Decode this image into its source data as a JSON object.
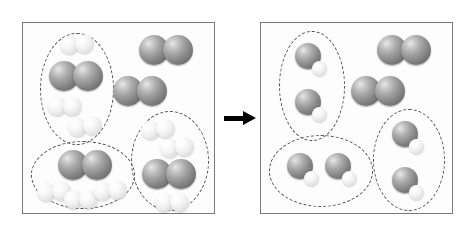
{
  "figure": {
    "width": 476,
    "height": 236,
    "background": "#ffffff",
    "description": "Particle-level before-and-after diagram of a chemical reaction shown in two bordered boxes separated by a right-pointing reaction arrow."
  },
  "colors": {
    "panel_border": "#7a7a7a",
    "panel_background": "#fdfdfd",
    "group_outline": "#4a4a4a",
    "dark_atom": "#8a8a8a",
    "light_atom": "#efefef",
    "arrow": "#000000"
  },
  "arrow": {
    "name": "reaction-arrow",
    "direction": "right",
    "color": "#000000",
    "label": ""
  },
  "legend": {
    "dark_diatomic": "dark two-atom molecule (reactant A2)",
    "light_diatomic": "light two-atom molecule (reactant B2)",
    "product": "large dark atom bonded to one small light atom (product AB)"
  },
  "panels": [
    {
      "id": "before",
      "name": "before-panel",
      "title": "Before reaction",
      "groups": [
        {
          "id": "before-group-1",
          "name": "reactant-group-top-left",
          "shape": "oval",
          "x": 17,
          "y": 10,
          "w": 74,
          "h": 112,
          "contents": {
            "dark_diatomic": 1,
            "light_diatomic": 3
          },
          "molecules": [
            {
              "type": "diatomic-light",
              "x": 20,
              "y": 2,
              "rot": -4
            },
            {
              "type": "diatomic-dark",
              "x": 9,
              "y": 28,
              "rot": 0
            },
            {
              "type": "diatomic-light",
              "x": 8,
              "y": 64,
              "rot": 0
            },
            {
              "type": "diatomic-light",
              "x": 28,
              "y": 84,
              "rot": -6
            }
          ]
        },
        {
          "id": "before-group-2",
          "name": "reactant-group-bottom-left",
          "shape": "oval",
          "x": 8,
          "y": 118,
          "w": 104,
          "h": 68,
          "contents": {
            "dark_diatomic": 1,
            "light_diatomic": 3
          },
          "molecules": [
            {
              "type": "diatomic-dark",
              "x": 27,
              "y": 9,
              "rot": 0
            },
            {
              "type": "diatomic-light",
              "x": 6,
              "y": 41,
              "rot": -4
            },
            {
              "type": "diatomic-light",
              "x": 33,
              "y": 49,
              "rot": 0
            },
            {
              "type": "diatomic-light",
              "x": 62,
              "y": 40,
              "rot": -5
            }
          ]
        },
        {
          "id": "before-group-3",
          "name": "reactant-group-bottom-right",
          "shape": "oval",
          "x": 108,
          "y": 88,
          "w": 78,
          "h": 100,
          "contents": {
            "dark_diatomic": 1,
            "light_diatomic": 3
          },
          "molecules": [
            {
              "type": "diatomic-light",
              "x": 10,
              "y": 9,
              "rot": -6
            },
            {
              "type": "diatomic-light",
              "x": 29,
              "y": 27,
              "rot": -6
            },
            {
              "type": "diatomic-dark",
              "x": 11,
              "y": 48,
              "rot": 0
            },
            {
              "type": "diatomic-light",
              "x": 24,
              "y": 82,
              "rot": 0
            }
          ]
        }
      ],
      "free_molecules": [
        {
          "type": "diatomic-dark",
          "name": "excess-dark-diatomic-1",
          "x": 116,
          "y": 12,
          "rot": 0
        },
        {
          "type": "diatomic-dark",
          "name": "excess-dark-diatomic-2",
          "x": 90,
          "y": 53,
          "rot": 0
        }
      ],
      "totals": {
        "dark_diatomic": 5,
        "light_diatomic": 9,
        "product": 0
      }
    },
    {
      "id": "after",
      "name": "after-panel",
      "title": "After reaction",
      "groups": [
        {
          "id": "after-group-1",
          "name": "product-group-top-left",
          "shape": "oval",
          "x": 18,
          "y": 8,
          "w": 66,
          "h": 110,
          "contents": {
            "product": 2
          },
          "molecules": [
            {
              "type": "product",
              "x": 16,
              "y": 12,
              "rot": 0
            },
            {
              "type": "product",
              "x": 16,
              "y": 58,
              "rot": 0
            }
          ]
        },
        {
          "id": "after-group-2",
          "name": "product-group-bottom-left",
          "shape": "oval",
          "x": 8,
          "y": 112,
          "w": 104,
          "h": 72,
          "contents": {
            "product": 2
          },
          "molecules": [
            {
              "type": "product",
              "x": 18,
              "y": 18,
              "rot": 0
            },
            {
              "type": "product",
              "x": 56,
              "y": 18,
              "rot": 0
            }
          ]
        },
        {
          "id": "after-group-3",
          "name": "product-group-bottom-right",
          "shape": "oval",
          "x": 112,
          "y": 86,
          "w": 72,
          "h": 102,
          "contents": {
            "product": 2
          },
          "molecules": [
            {
              "type": "product",
              "x": 19,
              "y": 12,
              "rot": 0
            },
            {
              "type": "product",
              "x": 19,
              "y": 58,
              "rot": 0
            }
          ]
        }
      ],
      "free_molecules": [
        {
          "type": "diatomic-dark",
          "name": "leftover-dark-diatomic-1",
          "x": 116,
          "y": 12,
          "rot": 0
        },
        {
          "type": "diatomic-dark",
          "name": "leftover-dark-diatomic-2",
          "x": 90,
          "y": 53,
          "rot": 0
        }
      ],
      "totals": {
        "dark_diatomic": 2,
        "light_diatomic": 0,
        "product": 6
      }
    }
  ]
}
